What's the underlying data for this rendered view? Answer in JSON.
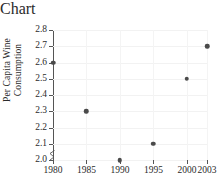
{
  "chart_data": {
    "type": "scatter",
    "title": "",
    "xlabel": "Year",
    "ylabel": "Per Capita Wine Consumption",
    "ylabel_lines": [
      "Per Capita Wine",
      "Consumption"
    ],
    "x": [
      1980,
      1985,
      1990,
      1995,
      2000,
      2003
    ],
    "values": [
      2.6,
      2.3,
      2.0,
      2.1,
      2.5,
      2.7
    ],
    "series": [
      {
        "name": "Per Capita Wine Consumption",
        "points": [
          {
            "x": 1980,
            "y": 2.6
          },
          {
            "x": 1985,
            "y": 2.3
          },
          {
            "x": 1990,
            "y": 2.0
          },
          {
            "x": 1995,
            "y": 2.1
          },
          {
            "x": 2000,
            "y": 2.5
          },
          {
            "x": 2003,
            "y": 2.7
          }
        ]
      }
    ],
    "xlim": [
      1980,
      2003
    ],
    "ylim": [
      2.0,
      2.8
    ],
    "xticks": [
      1980,
      1985,
      1990,
      1995,
      2000,
      2003
    ],
    "xticklabels": [
      "1980",
      "1985",
      "1990",
      "1995",
      "2000",
      "2003"
    ],
    "yticks": [
      2.0,
      2.1,
      2.2,
      2.3,
      2.4,
      2.5,
      2.6,
      2.7,
      2.8
    ],
    "yticklabels": [
      "2.0",
      "2.1",
      "2.2",
      "2.3",
      "2.4",
      "2.5",
      "2.6",
      "2.7",
      "2.8"
    ],
    "grid": true,
    "legend": "none",
    "y_axis_break": true,
    "marker_color": "#4a4a4a",
    "axis_color": "#555555",
    "grid_color": "#f2f2f2",
    "background": "#ffffff"
  }
}
